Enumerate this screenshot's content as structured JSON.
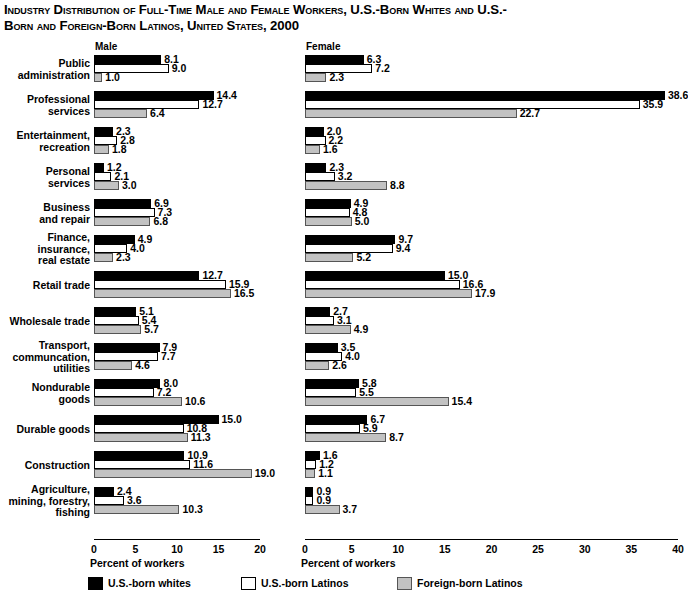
{
  "title": {
    "line1": "Industry Distribution of Full-Time Male and Female Workers, U.S.-Born Whites and U.S.-",
    "line2": "Born and Foreign-Born Latinos, United States, 2000"
  },
  "panels": {
    "male_heading": "Male",
    "female_heading": "Female",
    "male_axis_title": "Percent of workers",
    "female_axis_title": "Percent of workers"
  },
  "legend": [
    {
      "label": "U.S.-born whites",
      "color": "#000000"
    },
    {
      "label": "U.S.-born Latinos",
      "color": "#ffffff"
    },
    {
      "label": "Foreign-born Latinos",
      "color": "#c2c2c2"
    }
  ],
  "chart_data": [
    {
      "type": "bar",
      "orientation": "horizontal",
      "title": "Male",
      "xlabel": "Percent of workers",
      "ylabel": "",
      "xlim": [
        0,
        20
      ],
      "xticks": [
        0,
        5,
        10,
        15,
        20
      ],
      "grid": false,
      "legend_position": "bottom",
      "categories": [
        "Public administration",
        "Professional services",
        "Entertainment, recreation",
        "Personal services",
        "Business and repair",
        "Finance, insurance, real estate",
        "Retail trade",
        "Wholesale trade",
        "Transport, communcation, utilities",
        "Nondurable goods",
        "Durable goods",
        "Construction",
        "Agriculture, mining, forestry, fishing"
      ],
      "series": [
        {
          "name": "U.S.-born whites",
          "values": [
            8.1,
            14.4,
            2.3,
            1.2,
            6.9,
            4.9,
            12.7,
            5.1,
            7.9,
            8.0,
            15.0,
            10.9,
            2.4
          ]
        },
        {
          "name": "U.S.-born Latinos",
          "values": [
            9.0,
            12.7,
            2.8,
            2.1,
            7.3,
            4.0,
            15.9,
            5.4,
            7.7,
            7.2,
            10.8,
            11.6,
            3.6
          ]
        },
        {
          "name": "Foreign-born Latinos",
          "values": [
            1.0,
            6.4,
            1.8,
            3.0,
            6.8,
            2.3,
            16.5,
            5.7,
            4.6,
            10.6,
            11.3,
            19.0,
            10.3
          ]
        }
      ]
    },
    {
      "type": "bar",
      "orientation": "horizontal",
      "title": "Female",
      "xlabel": "Percent of workers",
      "ylabel": "",
      "xlim": [
        0,
        40
      ],
      "xticks": [
        0,
        5,
        10,
        15,
        20,
        25,
        30,
        35,
        40
      ],
      "grid": false,
      "legend_position": "bottom",
      "categories": [
        "Public administration",
        "Professional services",
        "Entertainment, recreation",
        "Personal services",
        "Business and repair",
        "Finance, insurance, real estate",
        "Retail trade",
        "Wholesale trade",
        "Transport, communcation, utilities",
        "Nondurable goods",
        "Durable goods",
        "Construction",
        "Agriculture, mining, forestry, fishing"
      ],
      "series": [
        {
          "name": "U.S.-born whites",
          "values": [
            6.3,
            38.6,
            2.0,
            2.3,
            4.9,
            9.7,
            15.0,
            2.7,
            3.5,
            5.8,
            6.7,
            1.6,
            0.9
          ]
        },
        {
          "name": "U.S.-born Latinos",
          "values": [
            7.2,
            35.9,
            2.2,
            3.2,
            4.8,
            9.4,
            16.6,
            3.1,
            4.0,
            5.5,
            5.9,
            1.2,
            0.9
          ]
        },
        {
          "name": "Foreign-born Latinos",
          "values": [
            2.3,
            22.7,
            1.6,
            8.8,
            5.0,
            5.2,
            17.9,
            4.9,
            2.6,
            15.4,
            8.7,
            1.1,
            3.7
          ]
        }
      ]
    }
  ],
  "category_label_lines": [
    [
      "Public",
      "administration"
    ],
    [
      "Professional",
      "services"
    ],
    [
      "Entertainment,",
      "recreation"
    ],
    [
      "Personal",
      "services"
    ],
    [
      "Business",
      "and repair"
    ],
    [
      "Finance,",
      "insurance,",
      "real estate"
    ],
    [
      "Retail trade"
    ],
    [
      "Wholesale trade"
    ],
    [
      "Transport,",
      "communcation,",
      "utilities"
    ],
    [
      "Nondurable",
      "goods"
    ],
    [
      "Durable goods"
    ],
    [
      "Construction"
    ],
    [
      "Agriculture,",
      "mining, forestry,",
      "fishing"
    ]
  ]
}
